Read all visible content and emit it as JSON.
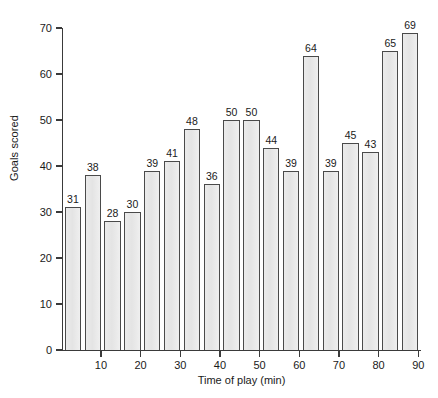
{
  "chart_data": {
    "type": "bar",
    "title": "",
    "xlabel": "Time of play (min)",
    "ylabel": "Goals scored",
    "categories": [
      "5",
      "10",
      "15",
      "20",
      "25",
      "30",
      "35",
      "40",
      "45",
      "50",
      "55",
      "60",
      "65",
      "70",
      "75",
      "80",
      "85",
      "90"
    ],
    "values": [
      31,
      38,
      28,
      30,
      39,
      41,
      48,
      36,
      50,
      50,
      44,
      39,
      64,
      39,
      45,
      43,
      65,
      69
    ],
    "value_labels": [
      "31",
      "38",
      "28",
      "30",
      "39",
      "41",
      "48",
      "36",
      "50",
      "50",
      "44",
      "39",
      "64",
      "39",
      "45",
      "43",
      "65",
      "69"
    ],
    "ylim": [
      0,
      70
    ],
    "ytick_values": [
      0,
      10,
      20,
      30,
      40,
      50,
      60,
      70
    ],
    "ytick_labels": [
      "0",
      "10",
      "20",
      "30",
      "40",
      "50",
      "60",
      "70"
    ],
    "xtick_values": [
      10,
      20,
      30,
      40,
      50,
      60,
      70,
      80,
      90
    ],
    "xtick_labels": [
      "10",
      "20",
      "30",
      "40",
      "50",
      "60",
      "70",
      "80",
      "90"
    ],
    "xlim": [
      0,
      90
    ],
    "grid": false,
    "legend": "none",
    "bar_fill_color": "#e9e9e9",
    "bar_edge_color": "#4a4a4a",
    "axis_color": "#3a3a3a",
    "text_color": "#1a1a1a",
    "background_color": "#ffffff"
  }
}
